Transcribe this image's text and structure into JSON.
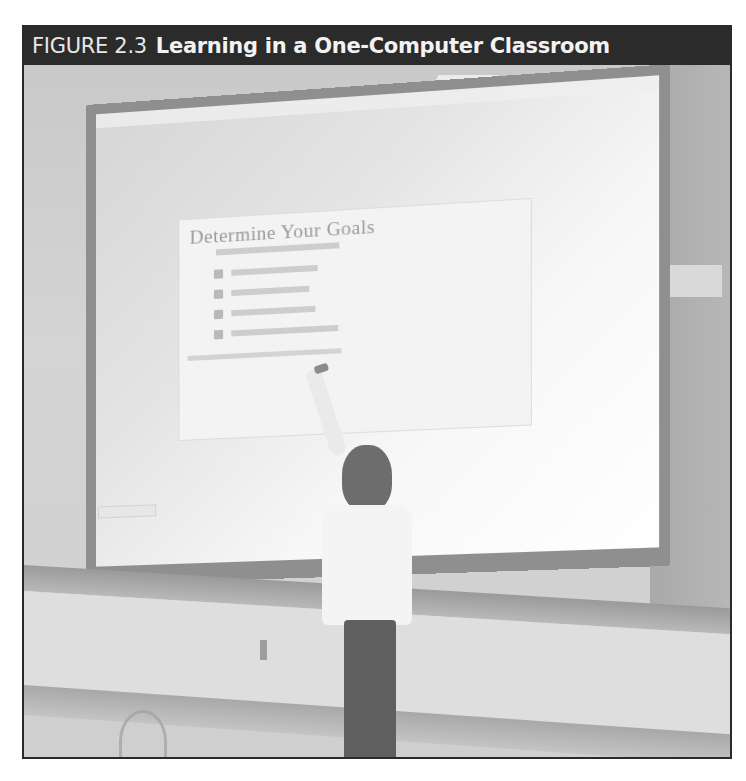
{
  "figure": {
    "label": "FIGURE 2.3",
    "title": "Learning in a One-Computer Classroom",
    "colors": {
      "header_bg": "#2b2b2b",
      "header_text": "#f2f2f2",
      "border": "#2a2a2a"
    }
  },
  "photo": {
    "description": "Teacher pointing at a projected slide on a classroom screen",
    "projected_slide": {
      "title": "Determine Your Goals",
      "subtitle_legible": false,
      "bullets": [
        {
          "legible": false,
          "width": 84
        },
        {
          "legible": false,
          "width": 76
        },
        {
          "legible": false,
          "width": 82
        },
        {
          "legible": false,
          "width": 104
        }
      ],
      "bottom_line_legible": false
    }
  }
}
